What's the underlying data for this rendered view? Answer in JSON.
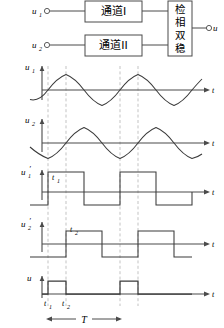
{
  "figure": {
    "stroke_color": "#3a3a3a",
    "dash_color": "#b9b9b9",
    "axis_color": "#4a4a4a"
  },
  "block_diagram": {
    "inputs": [
      {
        "label": "u",
        "sub": "1",
        "terminal": "open-circle"
      },
      {
        "label": "u",
        "sub": "2",
        "terminal": "open-circle"
      }
    ],
    "blocks": [
      {
        "name": "channel-1",
        "label": "通道I"
      },
      {
        "name": "channel-2",
        "label": "通道II"
      },
      {
        "name": "phase-bistable",
        "label": "检相双稳",
        "chars": [
          "检",
          "相",
          "双",
          "稳"
        ],
        "orientation": "vertical"
      }
    ],
    "output": {
      "label": "u",
      "terminal": "open-circle"
    }
  },
  "waveforms": [
    {
      "name": "u1",
      "label": "u",
      "sub": "1",
      "type": "sine",
      "axis_label": "t",
      "phase_deg": 180,
      "cycles": 2.6,
      "zero_rise_at": "t1"
    },
    {
      "name": "u2",
      "label": "u",
      "sub": "2",
      "type": "sine",
      "axis_label": "t",
      "phase_deg": 180,
      "cycles": 2.6,
      "zero_rise_at": "t2"
    },
    {
      "name": "u1-prime",
      "label": "u",
      "sub": "1",
      "prime": "′",
      "type": "square",
      "axis_label": "t",
      "marker": "t1",
      "marker_sub": "1"
    },
    {
      "name": "u2-prime",
      "label": "u",
      "sub": "2",
      "prime": "′",
      "type": "square",
      "axis_label": "t",
      "marker": "t2",
      "marker_sub": "2"
    },
    {
      "name": "u-out",
      "label": "u",
      "type": "pulse",
      "axis_label": "t",
      "pulse_count": 2
    }
  ],
  "time_axis": {
    "ticks": [
      {
        "name": "t1",
        "label": "t",
        "sub": "1"
      },
      {
        "name": "t2",
        "label": "t",
        "sub": "2"
      }
    ],
    "period": {
      "label": "T",
      "name": "period-measure"
    }
  }
}
